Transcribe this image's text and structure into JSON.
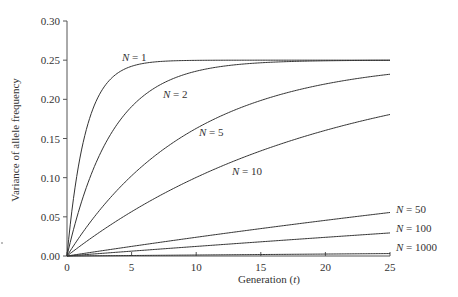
{
  "chart_data": {
    "type": "line",
    "title": "",
    "xlabel": "Generation (t)",
    "xlabel_parts": [
      "Generation (",
      "t",
      ")"
    ],
    "ylabel": "Variance of allele frequency",
    "xlim": [
      0,
      25
    ],
    "ylim": [
      0,
      0.3
    ],
    "x_ticks": [
      0,
      5,
      10,
      15,
      20,
      25
    ],
    "x_tick_labels": [
      "0",
      "5",
      "10",
      "15",
      "20",
      "25"
    ],
    "y_ticks": [
      0.0,
      0.05,
      0.1,
      0.15,
      0.2,
      0.25,
      0.3
    ],
    "y_tick_labels": [
      "0.00",
      "0.05",
      "0.10",
      "0.15",
      "0.20",
      "0.25",
      "0.30"
    ],
    "grid": false,
    "legend": "inline labels",
    "model": "V(t) = 0.25 * (1 - (1 - 1/(2N))^t)",
    "x": [
      0,
      1,
      2,
      3,
      4,
      5,
      6,
      8,
      10,
      12,
      15,
      18,
      20,
      22,
      25
    ],
    "series": [
      {
        "name": "N = 1",
        "N": 1,
        "label_var": "N",
        "label_val": "= 1",
        "values": [
          0,
          0.125,
          0.1875,
          0.2188,
          0.2344,
          0.2422,
          0.2461,
          0.249,
          0.2498,
          0.2499,
          0.25,
          0.25,
          0.25,
          0.25,
          0.25
        ]
      },
      {
        "name": "N = 2",
        "N": 2,
        "label_var": "N",
        "label_val": "= 2",
        "values": [
          0,
          0.0625,
          0.1094,
          0.1445,
          0.1709,
          0.1907,
          0.2055,
          0.2248,
          0.2359,
          0.2421,
          0.2467,
          0.2486,
          0.2492,
          0.2496,
          0.2498
        ]
      },
      {
        "name": "N = 5",
        "N": 5,
        "label_var": "N",
        "label_val": "= 5",
        "values": [
          0,
          0.025,
          0.0475,
          0.0678,
          0.086,
          0.1024,
          0.1172,
          0.1426,
          0.1628,
          0.1794,
          0.1985,
          0.2125,
          0.2197,
          0.2255,
          0.232
        ]
      },
      {
        "name": "N = 10",
        "N": 10,
        "label_var": "N",
        "label_val": "= 10",
        "values": [
          0,
          0.0125,
          0.0244,
          0.0357,
          0.0465,
          0.0566,
          0.0663,
          0.0839,
          0.1003,
          0.1149,
          0.1342,
          0.1507,
          0.1604,
          0.169,
          0.1807
        ]
      },
      {
        "name": "N = 50",
        "N": 50,
        "label_var": "N",
        "label_val": "= 50",
        "values": [
          0,
          0.0025,
          0.005,
          0.0074,
          0.0098,
          0.0122,
          0.0147,
          0.0192,
          0.0239,
          0.0284,
          0.035,
          0.0412,
          0.0455,
          0.0494,
          0.0555
        ]
      },
      {
        "name": "N = 100",
        "N": 100,
        "label_var": "N",
        "label_val": "= 100",
        "values": [
          0,
          0.00125,
          0.0025,
          0.0037,
          0.005,
          0.0062,
          0.0074,
          0.0098,
          0.0122,
          0.0146,
          0.0181,
          0.0215,
          0.0238,
          0.0261,
          0.0295
        ]
      },
      {
        "name": "N = 1000",
        "N": 1000,
        "label_var": "N",
        "label_val": "= 1000",
        "values": [
          0,
          0.000125,
          0.00025,
          0.000375,
          0.0005,
          0.000624,
          0.00075,
          0.000998,
          0.00125,
          0.0015,
          0.00187,
          0.00224,
          0.00249,
          0.00274,
          0.00311
        ]
      }
    ],
    "label_positions": [
      {
        "name": "N = 1",
        "x": 122,
        "y": 61
      },
      {
        "name": "N = 2",
        "x": 163,
        "y": 98
      },
      {
        "name": "N = 5",
        "x": 199,
        "y": 136
      },
      {
        "name": "N = 10",
        "x": 232,
        "y": 175
      },
      {
        "name": "N = 50",
        "x": 396,
        "y": 213
      },
      {
        "name": "N = 100",
        "x": 396,
        "y": 232
      },
      {
        "name": "N = 1000",
        "x": 396,
        "y": 251
      }
    ]
  },
  "layout": {
    "plot_left": 67,
    "plot_right": 390,
    "plot_top": 21,
    "plot_bottom": 256
  }
}
